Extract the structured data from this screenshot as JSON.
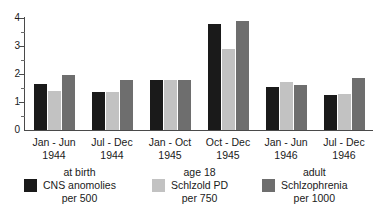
{
  "chart_data": {
    "type": "bar",
    "title": "",
    "subtitle": "",
    "xlabel": "",
    "ylabel": "",
    "ylim": [
      0,
      4
    ],
    "y_ticks": [
      0,
      1,
      2,
      3,
      4
    ],
    "y_tick_labels": [
      "0",
      "1",
      "2",
      "3",
      "4"
    ],
    "y_minor_ticks": [
      0.5,
      1.5,
      2.5,
      3.5
    ],
    "grid": false,
    "legend_position": "bottom",
    "categories": [
      {
        "line1": "Jan - Jun",
        "line2": "1944"
      },
      {
        "line1": "Jul - Dec",
        "line2": "1944"
      },
      {
        "line1": "Jan - Oct",
        "line2": "1945"
      },
      {
        "line1": "Oct - Dec",
        "line2": "1945"
      },
      {
        "line1": "Jan - Jun",
        "line2": "1946"
      },
      {
        "line1": "Jul - Dec",
        "line2": "1946"
      }
    ],
    "series": [
      {
        "name": "at birth CNS anomolies per 500",
        "legend_line1": "at birth",
        "legend_line2": "CNS anomolies",
        "legend_line3": "per 500",
        "color": "#1a1a1a",
        "values": [
          1.65,
          1.35,
          1.8,
          3.8,
          1.55,
          1.25
        ]
      },
      {
        "name": "age 18 Schlzold PD per 750",
        "legend_line1": "age 18",
        "legend_line2": "Schlzold PD",
        "legend_line3": "per 750",
        "color": "#c2c2c2",
        "values": [
          1.4,
          1.35,
          1.8,
          2.9,
          1.7,
          1.3
        ]
      },
      {
        "name": "adult Schlzophrenia per 1000",
        "legend_line1": "adult",
        "legend_line2": "Schlzophrenia",
        "legend_line3": "per 1000",
        "color": "#6e6e6e",
        "values": [
          1.95,
          1.8,
          1.78,
          3.9,
          1.6,
          1.85
        ]
      }
    ]
  },
  "colors": {
    "axis": "#4a4a4a",
    "background": "#ffffff",
    "series_1": "#1a1a1a",
    "series_2": "#c2c2c2",
    "series_3": "#6e6e6e"
  }
}
